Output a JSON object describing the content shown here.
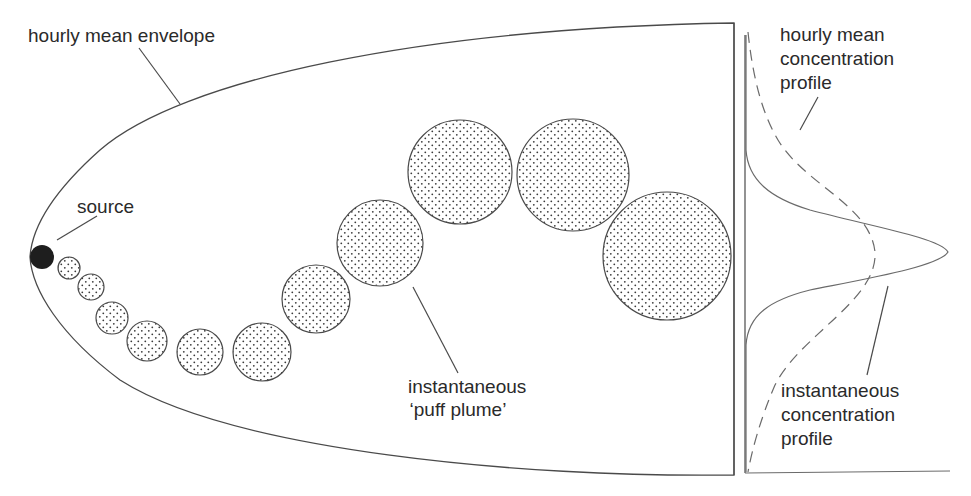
{
  "labels": {
    "envelope": "hourly mean envelope",
    "source": "source",
    "puff_line1": "instantaneous",
    "puff_line2": "‘puff plume’",
    "mean_profile_line1": "hourly mean",
    "mean_profile_line2": "concentration",
    "mean_profile_line3": "profile",
    "inst_profile_line1": "instantaneous",
    "inst_profile_line2": "concentration",
    "inst_profile_line3": "profile"
  },
  "colors": {
    "line": "#4a4a4a",
    "text": "#2a2a2a",
    "source_fill": "#1e1e1e",
    "puff_dot": "#3a3a3a",
    "background": "#ffffff"
  },
  "source": {
    "cx": 42,
    "cy": 257,
    "r": 12
  },
  "puffs": [
    {
      "cx": 69,
      "cy": 268,
      "r": 11
    },
    {
      "cx": 91,
      "cy": 287,
      "r": 13
    },
    {
      "cx": 112,
      "cy": 318,
      "r": 16
    },
    {
      "cx": 147,
      "cy": 341,
      "r": 20
    },
    {
      "cx": 200,
      "cy": 352,
      "r": 23
    },
    {
      "cx": 262,
      "cy": 352,
      "r": 29
    },
    {
      "cx": 316,
      "cy": 299,
      "r": 34
    },
    {
      "cx": 380,
      "cy": 243,
      "r": 43
    },
    {
      "cx": 460,
      "cy": 172,
      "r": 52
    },
    {
      "cx": 573,
      "cy": 175,
      "r": 56
    },
    {
      "cx": 667,
      "cy": 256,
      "r": 64
    }
  ]
}
